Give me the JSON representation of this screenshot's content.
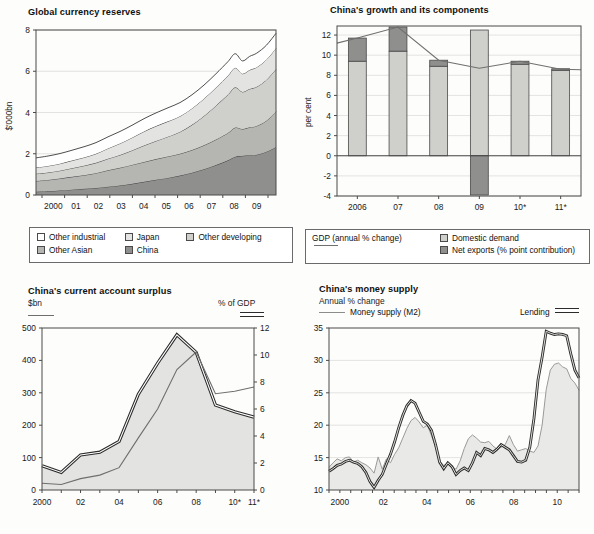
{
  "figure": {
    "background": "#fdfdfb",
    "panels": 4
  },
  "colors": {
    "white": "#ffffff",
    "light1": "#e3e3e1",
    "light2": "#cfcfcc",
    "mid": "#b5b5b2",
    "dark": "#8f8f8d",
    "line": "#6f6f6f",
    "axis": "#4a4a4a",
    "grid": "#d8d8d6",
    "text": "#1a1a1a"
  },
  "chart_data": [
    {
      "id": "global-currency-reserves",
      "type": "area",
      "stacked": true,
      "title": "Global currency reserves",
      "ylabel": "$'000bn",
      "xlabel": "",
      "ylim": [
        0,
        8
      ],
      "yticks": [
        0,
        2,
        4,
        6,
        8
      ],
      "ytick_labels": [
        "0",
        "2",
        "4",
        "6",
        "8"
      ],
      "xtick_labels": [
        "2000",
        "01",
        "02",
        "03",
        "04",
        "05",
        "06",
        "07",
        "08",
        "09"
      ],
      "grid": true,
      "legend_position": "below",
      "x": [
        1999.7,
        2000.2,
        2000.7,
        2001.2,
        2001.7,
        2002.2,
        2002.7,
        2003.2,
        2003.7,
        2004.2,
        2004.7,
        2005.2,
        2005.7,
        2006.2,
        2006.7,
        2007.2,
        2007.7,
        2008.0,
        2008.3,
        2008.6,
        2008.9,
        2009.3,
        2009.7
      ],
      "series": [
        {
          "name": "China",
          "color": "#8f8f8d",
          "values": [
            0.16,
            0.18,
            0.22,
            0.26,
            0.3,
            0.34,
            0.4,
            0.46,
            0.54,
            0.64,
            0.74,
            0.83,
            0.94,
            1.08,
            1.25,
            1.45,
            1.68,
            1.85,
            1.9,
            1.93,
            1.95,
            2.1,
            2.32
          ]
        },
        {
          "name": "Other Asian",
          "color": "#b5b5b2",
          "values": [
            0.52,
            0.55,
            0.58,
            0.62,
            0.66,
            0.72,
            0.8,
            0.86,
            0.92,
            0.96,
            1.0,
            1.04,
            1.06,
            1.1,
            1.16,
            1.24,
            1.33,
            1.42,
            1.3,
            1.35,
            1.4,
            1.5,
            1.72
          ]
        },
        {
          "name": "Other developing",
          "color": "#cfcfcc",
          "values": [
            0.35,
            0.36,
            0.38,
            0.42,
            0.46,
            0.5,
            0.56,
            0.62,
            0.7,
            0.8,
            0.88,
            0.96,
            1.06,
            1.22,
            1.42,
            1.64,
            1.86,
            1.95,
            1.8,
            1.86,
            1.9,
            1.98,
            2.06
          ]
        },
        {
          "name": "Japan",
          "color": "#e3e3e1",
          "values": [
            0.3,
            0.32,
            0.34,
            0.37,
            0.4,
            0.44,
            0.5,
            0.56,
            0.62,
            0.68,
            0.72,
            0.74,
            0.76,
            0.8,
            0.84,
            0.88,
            0.92,
            0.95,
            0.88,
            0.92,
            0.95,
            0.98,
            1.02
          ]
        },
        {
          "name": "Other industrial",
          "color": "#ffffff",
          "values": [
            0.47,
            0.48,
            0.49,
            0.5,
            0.52,
            0.54,
            0.56,
            0.58,
            0.6,
            0.62,
            0.64,
            0.66,
            0.66,
            0.66,
            0.66,
            0.67,
            0.68,
            0.68,
            0.62,
            0.66,
            0.68,
            0.7,
            0.72
          ]
        }
      ],
      "legend": [
        {
          "label": "Other industrial",
          "color": "#ffffff"
        },
        {
          "label": "Japan",
          "color": "#e3e3e1"
        },
        {
          "label": "Other developing",
          "color": "#cfcfcc"
        },
        {
          "label": "Other Asian",
          "color": "#b5b5b2"
        },
        {
          "label": "China",
          "color": "#8f8f8d"
        }
      ]
    },
    {
      "id": "chinas-growth-and-its-components",
      "type": "bar",
      "stacked": true,
      "title": "China's growth and its components",
      "ylabel": "per cent",
      "xlabel": "",
      "ylim": [
        -4,
        12.9
      ],
      "yticks": [
        -4,
        -2,
        0,
        2,
        4,
        6,
        8,
        10,
        12
      ],
      "ytick_labels": [
        "-4",
        "-2",
        "0",
        "2",
        "4",
        "6",
        "8",
        "10",
        "12"
      ],
      "categories": [
        "2006",
        "07",
        "08",
        "09",
        "10*",
        "11*"
      ],
      "grid": true,
      "legend_position": "below",
      "series": [
        {
          "name": "Domestic demand",
          "color": "#cfcfcc",
          "values": [
            9.4,
            10.4,
            8.9,
            12.5,
            9.1,
            8.5
          ]
        },
        {
          "name": "Net exports (% point contribution)",
          "color": "#8f8f8d",
          "values": [
            2.3,
            2.4,
            0.6,
            -3.9,
            0.3,
            0.15
          ]
        }
      ],
      "line_series": {
        "name": "GDP (annual % change)",
        "color": "#6f6f6f",
        "values": [
          11.7,
          12.8,
          9.5,
          8.7,
          9.4,
          8.6
        ]
      },
      "legend": [
        {
          "label": "GDP (annual % change)",
          "type": "line",
          "color": "#6f6f6f"
        },
        {
          "label": "Domestic demand",
          "type": "swatch",
          "color": "#cfcfcc"
        },
        {
          "label": "Net exports (% point contribution)",
          "type": "swatch",
          "color": "#8f8f8d"
        }
      ]
    },
    {
      "id": "chinas-current-account-surplus",
      "type": "area",
      "title": "China's current account surplus",
      "left_axis_label": "$bn",
      "right_axis_label": "% of GDP",
      "ylim": [
        0,
        500
      ],
      "yticks": [
        0,
        100,
        200,
        300,
        400,
        500
      ],
      "ytick_labels": [
        "0",
        "100",
        "200",
        "300",
        "400",
        "500"
      ],
      "y2lim": [
        0,
        12
      ],
      "y2ticks": [
        0,
        2,
        4,
        6,
        8,
        10,
        12
      ],
      "y2tick_labels": [
        "0",
        "2",
        "4",
        "6",
        "8",
        "10",
        "12"
      ],
      "xtick_labels": [
        "2000",
        "02",
        "04",
        "06",
        "08",
        "10*",
        "11*"
      ],
      "x": [
        2000,
        2001,
        2002,
        2003,
        2004,
        2005,
        2006,
        2007,
        2008,
        2009,
        2010,
        2011
      ],
      "grid": false,
      "series": [
        {
          "name": "% of GDP",
          "axis": "right",
          "style": "thick",
          "color": "#2b2b2b",
          "values": [
            1.8,
            1.3,
            2.6,
            2.8,
            3.6,
            7.1,
            9.4,
            11.5,
            10.2,
            6.3,
            5.8,
            5.4
          ]
        },
        {
          "name": "$bn",
          "axis": "left",
          "style": "thin",
          "color": "#6f6f6f",
          "values": [
            21,
            17,
            35,
            46,
            69,
            161,
            250,
            372,
            426,
            297,
            305,
            318
          ]
        }
      ],
      "legend": [
        {
          "label": "$bn",
          "type": "thin-line",
          "color": "#6f6f6f"
        },
        {
          "label": "% of GDP",
          "type": "thick-line",
          "color": "#2b2b2b"
        }
      ]
    },
    {
      "id": "chinas-money-supply",
      "type": "line",
      "title": "China's money supply",
      "subtitle": "Annual % change",
      "ylim": [
        10,
        35
      ],
      "yticks": [
        10,
        15,
        20,
        25,
        30,
        35
      ],
      "ytick_labels": [
        "10",
        "15",
        "20",
        "25",
        "30",
        "35"
      ],
      "xtick_labels": [
        "2000",
        "02",
        "04",
        "06",
        "08",
        "10"
      ],
      "grid": true,
      "series": [
        {
          "name": "Money supply (M2)",
          "style": "thin",
          "color": "#9a9a98",
          "values": [
            13.5,
            14.2,
            14.8,
            14.5,
            15.0,
            15.1,
            14.3,
            14.6,
            14.2,
            13.9,
            13.4,
            12.6,
            15.1,
            13.2,
            14.8,
            14.2,
            15.5,
            16.5,
            18.0,
            19.5,
            20.7,
            21.2,
            20.5,
            19.6,
            20.0,
            18.4,
            16.6,
            14.4,
            13.8,
            14.0,
            13.6,
            13.2,
            14.5,
            16.4,
            17.9,
            18.5,
            18.0,
            17.4,
            17.3,
            17.5,
            16.8,
            16.3,
            16.6,
            17.0,
            18.4,
            17.0,
            16.0,
            16.2,
            16.4,
            16.0,
            15.8,
            16.8,
            20.0,
            25.5,
            28.5,
            29.4,
            29.6,
            29.0,
            28.7,
            27.2,
            26.5,
            25.4
          ]
        },
        {
          "name": "Lending",
          "style": "thick",
          "color": "#2b2b2b",
          "values": [
            12.9,
            13.3,
            13.8,
            14.0,
            14.4,
            14.6,
            14.3,
            14.1,
            13.6,
            12.7,
            11.3,
            10.4,
            11.5,
            12.4,
            14.0,
            15.5,
            17.4,
            19.6,
            21.5,
            23.0,
            23.8,
            23.4,
            22.0,
            20.6,
            20.2,
            19.2,
            17.0,
            14.3,
            13.3,
            14.2,
            13.6,
            12.4,
            13.0,
            13.4,
            13.0,
            14.2,
            15.8,
            15.3,
            16.4,
            16.2,
            15.8,
            16.3,
            17.0,
            16.6,
            16.2,
            15.3,
            14.4,
            14.3,
            14.6,
            16.6,
            21.0,
            27.0,
            30.5,
            34.5,
            34.2,
            34.0,
            34.1,
            34.0,
            33.8,
            31.0,
            28.5,
            27.3
          ]
        }
      ],
      "legend": [
        {
          "label": "Money supply (M2)",
          "type": "thin-line",
          "color": "#9a9a98"
        },
        {
          "label": "Lending",
          "type": "thick-line",
          "color": "#2b2b2b"
        }
      ]
    }
  ]
}
